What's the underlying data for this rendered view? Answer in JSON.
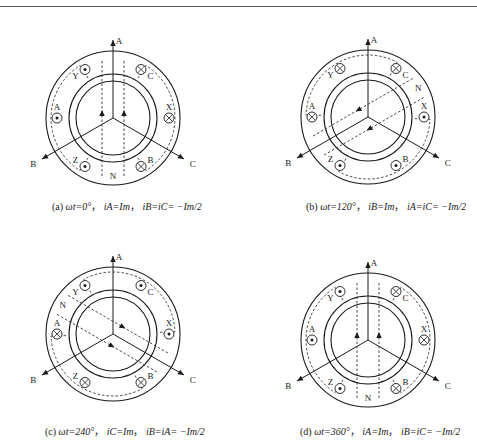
{
  "header": {
    "page_number": "200",
    "running_title": "电机与拖动基础"
  },
  "figure": {
    "panels": [
      {
        "id": "a",
        "center": [
          113,
          118
        ],
        "flux_angle_deg": 90,
        "slots": {
          "A": {
            "angle": 180,
            "symbol": "dot"
          },
          "X": {
            "angle": 0,
            "symbol": "cross"
          },
          "B": {
            "angle": -60,
            "symbol": "cross"
          },
          "Y": {
            "angle": 120,
            "symbol": "dot"
          },
          "C": {
            "angle": 60,
            "symbol": "cross"
          },
          "Z": {
            "angle": -120,
            "symbol": "dot"
          }
        },
        "pole_label": "N",
        "caption": {
          "prefix": "(a)",
          "omega_t": "ωt=0°",
          "primary": "iA=Im",
          "secondary": "iB=iC= −Im/2"
        }
      },
      {
        "id": "b",
        "center": [
          368,
          117
        ],
        "flux_angle_deg": -150,
        "slots": {
          "A": {
            "angle": 180,
            "symbol": "cross"
          },
          "X": {
            "angle": 0,
            "symbol": "dot"
          },
          "B": {
            "angle": -60,
            "symbol": "dot"
          },
          "Y": {
            "angle": 120,
            "symbol": "cross"
          },
          "C": {
            "angle": 60,
            "symbol": "cross"
          },
          "Z": {
            "angle": -120,
            "symbol": "dot"
          }
        },
        "pole_label": "N",
        "caption": {
          "prefix": "(b)",
          "omega_t": "ωt=120°",
          "primary": "iB=Im",
          "secondary": "iA=iC= −Im/2"
        }
      },
      {
        "id": "c",
        "center": [
          113,
          334
        ],
        "flux_angle_deg": -30,
        "slots": {
          "A": {
            "angle": 180,
            "symbol": "cross"
          },
          "X": {
            "angle": 0,
            "symbol": "dot"
          },
          "B": {
            "angle": -60,
            "symbol": "cross"
          },
          "Y": {
            "angle": 120,
            "symbol": "dot"
          },
          "C": {
            "angle": 60,
            "symbol": "dot"
          },
          "Z": {
            "angle": -120,
            "symbol": "cross"
          }
        },
        "pole_label": "N",
        "caption": {
          "prefix": "(c)",
          "omega_t": "ωt=240°",
          "primary": "iC=Im",
          "secondary": "iB=iA= −Im/2"
        }
      },
      {
        "id": "d",
        "center": [
          368,
          340
        ],
        "flux_angle_deg": 90,
        "slots": {
          "A": {
            "angle": 180,
            "symbol": "dot"
          },
          "X": {
            "angle": 0,
            "symbol": "cross"
          },
          "B": {
            "angle": -60,
            "symbol": "cross"
          },
          "Y": {
            "angle": 120,
            "symbol": "dot"
          },
          "C": {
            "angle": 60,
            "symbol": "cross"
          },
          "Z": {
            "angle": -120,
            "symbol": "dot"
          }
        },
        "pole_label": "N",
        "caption": {
          "prefix": "(d)",
          "omega_t": "ωt=360°",
          "primary": "iA=Im",
          "secondary": "iB=iC= −Im/2"
        }
      }
    ],
    "axis_labels": {
      "A": "A",
      "B": "B",
      "C": "C"
    },
    "colors": {
      "line": "#1a1a1a",
      "dashed": "#333333",
      "background": "#ffffff"
    }
  }
}
